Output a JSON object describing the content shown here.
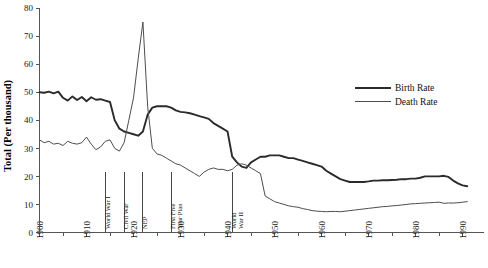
{
  "chart_data": {
    "type": "line",
    "title": "",
    "subtitle": "",
    "xlabel": "",
    "ylabel": "Total (Per thousand)",
    "xlim": [
      1900,
      1992
    ],
    "ylim": [
      0,
      80
    ],
    "grid": false,
    "legend_position": "right-upper",
    "y_ticks": [
      0,
      10,
      20,
      30,
      40,
      50,
      60,
      70,
      80
    ],
    "y_tick_labels": [
      "0",
      "10",
      "20",
      "30",
      "40",
      "50",
      "60",
      "70",
      "80"
    ],
    "x_ticks": [
      1900,
      1910,
      1920,
      1930,
      1940,
      1950,
      1960,
      1970,
      1980,
      1990
    ],
    "x_tick_labels": [
      "1900",
      "1910",
      "1920",
      "1930",
      "1940",
      "1950",
      "1960",
      "1970",
      "1980",
      "1990"
    ],
    "x_minor_ticks": [
      1905,
      1915,
      1925,
      1935,
      1945,
      1955,
      1965,
      1975,
      1985
    ],
    "annotations": [
      {
        "label": "World War I",
        "year": 1914
      },
      {
        "label": "Civil War",
        "year": 1918
      },
      {
        "label": "NEP",
        "year": 1922
      },
      {
        "label": "First Five\nYear Plan",
        "year": 1928
      },
      {
        "label": "World\nWar II",
        "year": 1941
      }
    ],
    "series": [
      {
        "name": "Birth Rate",
        "color": "#2b2b2b",
        "x": [
          1900,
          1901,
          1902,
          1903,
          1904,
          1905,
          1906,
          1907,
          1908,
          1909,
          1910,
          1911,
          1912,
          1913,
          1914,
          1915,
          1916,
          1917,
          1918,
          1919,
          1920,
          1921,
          1922,
          1923,
          1924,
          1925,
          1926,
          1927,
          1928,
          1929,
          1930,
          1931,
          1932,
          1933,
          1934,
          1935,
          1936,
          1937,
          1938,
          1939,
          1940,
          1941,
          1942,
          1943,
          1944,
          1945,
          1946,
          1947,
          1948,
          1949,
          1950,
          1951,
          1952,
          1953,
          1954,
          1955,
          1956,
          1957,
          1958,
          1959,
          1960,
          1961,
          1962,
          1963,
          1964,
          1965,
          1966,
          1967,
          1968,
          1969,
          1970,
          1971,
          1972,
          1973,
          1974,
          1975,
          1976,
          1977,
          1978,
          1979,
          1980,
          1981,
          1982,
          1983,
          1984,
          1985,
          1986,
          1987,
          1988,
          1989,
          1990,
          1991
        ],
        "values": [
          50.0,
          49.8,
          50.2,
          49.6,
          50.2,
          48.0,
          47.0,
          48.5,
          47.2,
          48.3,
          46.8,
          48.2,
          47.3,
          47.5,
          47.0,
          46.5,
          40.0,
          37.0,
          36.0,
          35.5,
          35.0,
          34.5,
          36.0,
          42.0,
          44.5,
          45.0,
          45.0,
          45.0,
          44.5,
          43.5,
          43.0,
          42.8,
          42.5,
          42.0,
          41.5,
          41.0,
          40.5,
          39.0,
          38.0,
          37.0,
          36.0,
          27.0,
          25.0,
          23.5,
          23.0,
          25.0,
          26.0,
          27.0,
          27.0,
          27.5,
          27.5,
          27.5,
          27.0,
          26.5,
          26.5,
          26.0,
          25.5,
          25.0,
          24.5,
          24.0,
          23.5,
          22.0,
          21.0,
          20.0,
          19.0,
          18.5,
          18.0,
          18.0,
          18.0,
          18.0,
          18.2,
          18.5,
          18.5,
          18.6,
          18.6,
          18.7,
          18.8,
          19.0,
          19.0,
          19.2,
          19.2,
          19.5,
          20.0,
          20.0,
          20.0,
          20.0,
          20.2,
          19.8,
          18.5,
          17.5,
          16.8,
          16.5
        ]
      },
      {
        "name": "Death Rate",
        "color": "#4d4d4d",
        "x": [
          1900,
          1901,
          1902,
          1903,
          1904,
          1905,
          1906,
          1907,
          1908,
          1909,
          1910,
          1911,
          1912,
          1913,
          1914,
          1915,
          1916,
          1917,
          1918,
          1919,
          1920,
          1921,
          1922,
          1923,
          1924,
          1925,
          1926,
          1927,
          1928,
          1929,
          1930,
          1931,
          1932,
          1933,
          1934,
          1935,
          1936,
          1937,
          1938,
          1939,
          1940,
          1941,
          1942,
          1943,
          1944,
          1945,
          1946,
          1947,
          1948,
          1949,
          1950,
          1951,
          1952,
          1953,
          1954,
          1955,
          1956,
          1957,
          1958,
          1959,
          1960,
          1961,
          1962,
          1963,
          1964,
          1965,
          1966,
          1967,
          1968,
          1969,
          1970,
          1971,
          1972,
          1973,
          1974,
          1975,
          1976,
          1977,
          1978,
          1979,
          1980,
          1981,
          1982,
          1983,
          1984,
          1985,
          1986,
          1987,
          1988,
          1989,
          1990,
          1991
        ],
        "values": [
          33.0,
          32.0,
          32.5,
          31.5,
          31.8,
          31.0,
          32.5,
          31.8,
          31.5,
          32.0,
          34.0,
          31.5,
          29.5,
          30.5,
          32.5,
          33.0,
          30.0,
          29.0,
          32.0,
          40.0,
          48.0,
          62.0,
          75.0,
          45.0,
          30.0,
          28.0,
          27.5,
          26.5,
          25.5,
          24.5,
          24.0,
          23.0,
          22.0,
          21.0,
          20.0,
          21.5,
          22.5,
          23.0,
          22.5,
          22.5,
          22.0,
          22.5,
          24.0,
          24.5,
          24.0,
          23.0,
          22.0,
          21.0,
          13.0,
          12.0,
          11.0,
          10.5,
          10.0,
          9.5,
          9.2,
          9.0,
          8.5,
          8.2,
          7.8,
          7.6,
          7.5,
          7.4,
          7.5,
          7.5,
          7.4,
          7.6,
          7.8,
          8.0,
          8.2,
          8.4,
          8.6,
          8.8,
          9.0,
          9.2,
          9.3,
          9.5,
          9.6,
          9.8,
          10.0,
          10.2,
          10.3,
          10.4,
          10.5,
          10.6,
          10.7,
          10.8,
          10.4,
          10.5,
          10.5,
          10.6,
          10.8,
          11.0
        ]
      }
    ],
    "legend": [
      {
        "label": "Birth Rate",
        "color": "#2b2b2b"
      },
      {
        "label": "Death Rate",
        "color": "#4d4d4d"
      }
    ]
  }
}
